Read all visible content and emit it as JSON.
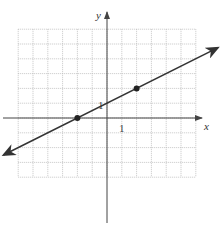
{
  "chart_data": {
    "type": "line",
    "title": "",
    "xlabel": "x",
    "ylabel": "y",
    "xlim": [
      -6,
      6
    ],
    "ylim": [
      -4,
      6
    ],
    "grid": true,
    "tick_labels": {
      "x": "1",
      "y": "1"
    },
    "series": [
      {
        "name": "line",
        "slope": 0.5,
        "intercept": 1,
        "x_range": [
          -7,
          7.5
        ],
        "arrows": "both",
        "color": "#333333"
      }
    ],
    "points": [
      {
        "x": -2,
        "y": 0
      },
      {
        "x": 2,
        "y": 2
      }
    ],
    "colors": {
      "grid": "#b8b8b8",
      "axis": "#444444",
      "line": "#333333"
    }
  }
}
